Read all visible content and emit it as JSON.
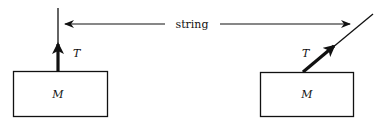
{
  "diagram": {
    "label_string": "string",
    "left_block": {
      "mass_label": "M",
      "tension_label": "T",
      "string_orientation": "vertical"
    },
    "right_block": {
      "mass_label": "M",
      "tension_label": "T",
      "string_orientation": "angled"
    },
    "colors": {
      "ink": "#111111",
      "background": "#ffffff"
    }
  }
}
